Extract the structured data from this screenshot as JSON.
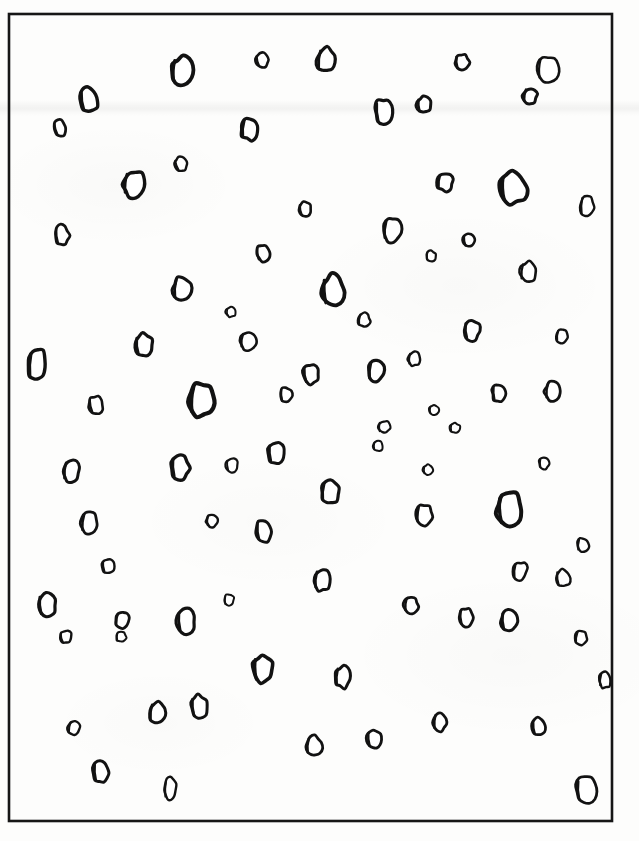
{
  "figure": {
    "title": "",
    "caption": "",
    "medium": "scanned line drawing",
    "background_color": "#fdfdfc",
    "ink_color": "#121212"
  },
  "frame": {
    "x": 9,
    "y": 14,
    "width": 603,
    "height": 807,
    "stroke_color": "#161616",
    "stroke_width": 2.6
  },
  "chart_data": {
    "type": "scatter",
    "title": "",
    "xlabel": "",
    "ylabel": "",
    "xlim": [
      9,
      612
    ],
    "ylim": [
      14,
      821
    ],
    "grid": false,
    "legend": false,
    "marker_style": "hand-drawn irregular oval outline",
    "count": 85,
    "note": "Each point is an irregular closed outline (particle / cell profile) drawn by hand; rx and ry are the semi-axes in pixels, rot is the rotation in degrees, w is the pen stroke width in pixels, and seed drives the outline irregularity.",
    "points": [
      {
        "id": 1,
        "cx": 89,
        "cy": 100,
        "rx": 9,
        "ry": 12,
        "rot": -8,
        "w": 3.4,
        "seed": 11
      },
      {
        "id": 2,
        "cx": 182,
        "cy": 71,
        "rx": 11,
        "ry": 14,
        "rot": 4,
        "w": 3.8,
        "seed": 23
      },
      {
        "id": 3,
        "cx": 262,
        "cy": 60,
        "rx": 6,
        "ry": 7,
        "rot": -14,
        "w": 2.6,
        "seed": 37
      },
      {
        "id": 4,
        "cx": 326,
        "cy": 60,
        "rx": 9,
        "ry": 12,
        "rot": 6,
        "w": 3.2,
        "seed": 41
      },
      {
        "id": 5,
        "cx": 462,
        "cy": 62,
        "rx": 7,
        "ry": 8,
        "rot": -6,
        "w": 2.8,
        "seed": 53
      },
      {
        "id": 6,
        "cx": 548,
        "cy": 69,
        "rx": 11,
        "ry": 13,
        "rot": 3,
        "w": 2.6,
        "seed": 59
      },
      {
        "id": 7,
        "cx": 60,
        "cy": 128,
        "rx": 6,
        "ry": 8,
        "rot": -16,
        "w": 2.8,
        "seed": 67
      },
      {
        "id": 8,
        "cx": 250,
        "cy": 129,
        "rx": 9,
        "ry": 11,
        "rot": 5,
        "w": 3.2,
        "seed": 71
      },
      {
        "id": 9,
        "cx": 384,
        "cy": 112,
        "rx": 9,
        "ry": 13,
        "rot": -5,
        "w": 3.2,
        "seed": 83
      },
      {
        "id": 10,
        "cx": 530,
        "cy": 96,
        "rx": 7,
        "ry": 8,
        "rot": 10,
        "w": 3.0,
        "seed": 89
      },
      {
        "id": 11,
        "cx": 181,
        "cy": 164,
        "rx": 6,
        "ry": 7,
        "rot": -20,
        "w": 2.4,
        "seed": 97
      },
      {
        "id": 12,
        "cx": 134,
        "cy": 184,
        "rx": 11,
        "ry": 13,
        "rot": 6,
        "w": 3.4,
        "seed": 101
      },
      {
        "id": 13,
        "cx": 305,
        "cy": 209,
        "rx": 6,
        "ry": 7,
        "rot": -11,
        "w": 2.6,
        "seed": 103
      },
      {
        "id": 14,
        "cx": 445,
        "cy": 182,
        "rx": 8,
        "ry": 9,
        "rot": 7,
        "w": 3.0,
        "seed": 107
      },
      {
        "id": 15,
        "cx": 513,
        "cy": 188,
        "rx": 13,
        "ry": 16,
        "rot": -3,
        "w": 3.8,
        "seed": 109
      },
      {
        "id": 16,
        "cx": 587,
        "cy": 206,
        "rx": 7,
        "ry": 11,
        "rot": 2,
        "w": 2.4,
        "seed": 113
      },
      {
        "id": 17,
        "cx": 62,
        "cy": 235,
        "rx": 7,
        "ry": 10,
        "rot": -7,
        "w": 2.8,
        "seed": 127
      },
      {
        "id": 18,
        "cx": 392,
        "cy": 230,
        "rx": 9,
        "ry": 12,
        "rot": 5,
        "w": 3.0,
        "seed": 131
      },
      {
        "id": 19,
        "cx": 263,
        "cy": 253,
        "rx": 7,
        "ry": 8,
        "rot": -9,
        "w": 2.8,
        "seed": 137
      },
      {
        "id": 20,
        "cx": 431,
        "cy": 256,
        "rx": 5,
        "ry": 5,
        "rot": 0,
        "w": 2.2,
        "seed": 139
      },
      {
        "id": 21,
        "cx": 182,
        "cy": 289,
        "rx": 9,
        "ry": 12,
        "rot": 4,
        "w": 3.2,
        "seed": 149
      },
      {
        "id": 22,
        "cx": 333,
        "cy": 291,
        "rx": 11,
        "ry": 16,
        "rot": -4,
        "w": 3.8,
        "seed": 151
      },
      {
        "id": 23,
        "cx": 528,
        "cy": 272,
        "rx": 8,
        "ry": 10,
        "rot": 6,
        "w": 2.6,
        "seed": 157
      },
      {
        "id": 24,
        "cx": 144,
        "cy": 345,
        "rx": 9,
        "ry": 11,
        "rot": -6,
        "w": 3.2,
        "seed": 163
      },
      {
        "id": 25,
        "cx": 248,
        "cy": 341,
        "rx": 8,
        "ry": 9,
        "rot": 8,
        "w": 2.6,
        "seed": 167
      },
      {
        "id": 26,
        "cx": 472,
        "cy": 330,
        "rx": 8,
        "ry": 10,
        "rot": -5,
        "w": 3.0,
        "seed": 173
      },
      {
        "id": 27,
        "cx": 37,
        "cy": 365,
        "rx": 9,
        "ry": 16,
        "rot": 3,
        "w": 3.4,
        "seed": 179
      },
      {
        "id": 28,
        "cx": 311,
        "cy": 374,
        "rx": 8,
        "ry": 10,
        "rot": -8,
        "w": 3.0,
        "seed": 181
      },
      {
        "id": 29,
        "cx": 376,
        "cy": 371,
        "rx": 8,
        "ry": 11,
        "rot": 5,
        "w": 3.2,
        "seed": 191
      },
      {
        "id": 30,
        "cx": 499,
        "cy": 393,
        "rx": 7,
        "ry": 9,
        "rot": -4,
        "w": 2.8,
        "seed": 193
      },
      {
        "id": 31,
        "cx": 553,
        "cy": 391,
        "rx": 8,
        "ry": 10,
        "rot": 6,
        "w": 2.8,
        "seed": 197
      },
      {
        "id": 32,
        "cx": 96,
        "cy": 405,
        "rx": 7,
        "ry": 9,
        "rot": -12,
        "w": 2.6,
        "seed": 199
      },
      {
        "id": 33,
        "cx": 202,
        "cy": 400,
        "rx": 13,
        "ry": 17,
        "rot": 4,
        "w": 4.2,
        "seed": 211
      },
      {
        "id": 34,
        "cx": 384,
        "cy": 427,
        "rx": 6,
        "ry": 6,
        "rot": 0,
        "w": 2.2,
        "seed": 223
      },
      {
        "id": 35,
        "cx": 434,
        "cy": 410,
        "rx": 5,
        "ry": 5,
        "rot": 0,
        "w": 2.0,
        "seed": 227
      },
      {
        "id": 36,
        "cx": 276,
        "cy": 453,
        "rx": 8,
        "ry": 11,
        "rot": -5,
        "w": 3.0,
        "seed": 229
      },
      {
        "id": 37,
        "cx": 71,
        "cy": 471,
        "rx": 8,
        "ry": 11,
        "rot": 6,
        "w": 3.0,
        "seed": 233
      },
      {
        "id": 38,
        "cx": 180,
        "cy": 467,
        "rx": 9,
        "ry": 12,
        "rot": -4,
        "w": 3.4,
        "seed": 239
      },
      {
        "id": 39,
        "cx": 544,
        "cy": 463,
        "rx": 5,
        "ry": 6,
        "rot": 0,
        "w": 2.2,
        "seed": 241
      },
      {
        "id": 40,
        "cx": 330,
        "cy": 492,
        "rx": 9,
        "ry": 12,
        "rot": 5,
        "w": 3.2,
        "seed": 251
      },
      {
        "id": 41,
        "cx": 510,
        "cy": 510,
        "rx": 13,
        "ry": 17,
        "rot": -4,
        "w": 4.0,
        "seed": 257
      },
      {
        "id": 42,
        "cx": 89,
        "cy": 523,
        "rx": 8,
        "ry": 11,
        "rot": 7,
        "w": 2.8,
        "seed": 263
      },
      {
        "id": 43,
        "cx": 212,
        "cy": 521,
        "rx": 6,
        "ry": 6,
        "rot": 0,
        "w": 2.4,
        "seed": 269
      },
      {
        "id": 44,
        "cx": 264,
        "cy": 531,
        "rx": 8,
        "ry": 11,
        "rot": -6,
        "w": 3.0,
        "seed": 271
      },
      {
        "id": 45,
        "cx": 424,
        "cy": 515,
        "rx": 8,
        "ry": 10,
        "rot": 4,
        "w": 2.8,
        "seed": 277
      },
      {
        "id": 46,
        "cx": 563,
        "cy": 578,
        "rx": 7,
        "ry": 9,
        "rot": -7,
        "w": 2.4,
        "seed": 281
      },
      {
        "id": 47,
        "cx": 322,
        "cy": 580,
        "rx": 8,
        "ry": 11,
        "rot": 5,
        "w": 3.0,
        "seed": 283
      },
      {
        "id": 48,
        "cx": 47,
        "cy": 605,
        "rx": 9,
        "ry": 12,
        "rot": -5,
        "w": 3.2,
        "seed": 293
      },
      {
        "id": 49,
        "cx": 122,
        "cy": 620,
        "rx": 7,
        "ry": 8,
        "rot": 9,
        "w": 2.8,
        "seed": 307
      },
      {
        "id": 50,
        "cx": 186,
        "cy": 621,
        "rx": 9,
        "ry": 12,
        "rot": -4,
        "w": 3.2,
        "seed": 311
      },
      {
        "id": 51,
        "cx": 411,
        "cy": 605,
        "rx": 7,
        "ry": 8,
        "rot": 6,
        "w": 2.8,
        "seed": 313
      },
      {
        "id": 52,
        "cx": 509,
        "cy": 621,
        "rx": 8,
        "ry": 11,
        "rot": -5,
        "w": 3.0,
        "seed": 317
      },
      {
        "id": 53,
        "cx": 66,
        "cy": 637,
        "rx": 6,
        "ry": 6,
        "rot": -15,
        "w": 2.4,
        "seed": 331
      },
      {
        "id": 54,
        "cx": 581,
        "cy": 638,
        "rx": 6,
        "ry": 7,
        "rot": 8,
        "w": 2.4,
        "seed": 337
      },
      {
        "id": 55,
        "cx": 343,
        "cy": 677,
        "rx": 8,
        "ry": 11,
        "rot": 4,
        "w": 3.0,
        "seed": 347
      },
      {
        "id": 56,
        "cx": 263,
        "cy": 669,
        "rx": 10,
        "ry": 14,
        "rot": -3,
        "w": 3.6,
        "seed": 349
      },
      {
        "id": 57,
        "cx": 157,
        "cy": 713,
        "rx": 8,
        "ry": 11,
        "rot": 6,
        "w": 3.0,
        "seed": 353
      },
      {
        "id": 58,
        "cx": 199,
        "cy": 707,
        "rx": 8,
        "ry": 12,
        "rot": -5,
        "w": 3.0,
        "seed": 359
      },
      {
        "id": 59,
        "cx": 74,
        "cy": 728,
        "rx": 6,
        "ry": 7,
        "rot": 10,
        "w": 2.4,
        "seed": 367
      },
      {
        "id": 60,
        "cx": 374,
        "cy": 739,
        "rx": 7,
        "ry": 9,
        "rot": -6,
        "w": 2.8,
        "seed": 373
      },
      {
        "id": 61,
        "cx": 440,
        "cy": 722,
        "rx": 7,
        "ry": 9,
        "rot": 5,
        "w": 2.8,
        "seed": 379
      },
      {
        "id": 62,
        "cx": 539,
        "cy": 727,
        "rx": 7,
        "ry": 9,
        "rot": -7,
        "w": 2.8,
        "seed": 383
      },
      {
        "id": 63,
        "cx": 314,
        "cy": 746,
        "rx": 8,
        "ry": 10,
        "rot": 4,
        "w": 2.8,
        "seed": 389
      },
      {
        "id": 64,
        "cx": 101,
        "cy": 772,
        "rx": 8,
        "ry": 11,
        "rot": -4,
        "w": 3.0,
        "seed": 397
      },
      {
        "id": 65,
        "cx": 170,
        "cy": 789,
        "rx": 6,
        "ry": 11,
        "rot": 2,
        "w": 2.4,
        "seed": 401
      },
      {
        "id": 66,
        "cx": 586,
        "cy": 790,
        "rx": 10,
        "ry": 13,
        "rot": -3,
        "w": 2.8,
        "seed": 409
      },
      {
        "id": 67,
        "cx": 328,
        "cy": 41,
        "rx": 0,
        "ry": 0,
        "rot": 0,
        "w": 0,
        "seed": 0
      },
      {
        "id": 68,
        "cx": 424,
        "cy": 105,
        "rx": 7,
        "ry": 8,
        "rot": -5,
        "w": 3.0,
        "seed": 419
      },
      {
        "id": 69,
        "cx": 231,
        "cy": 312,
        "rx": 5,
        "ry": 5,
        "rot": 0,
        "w": 2.0,
        "seed": 421
      },
      {
        "id": 70,
        "cx": 428,
        "cy": 470,
        "rx": 5,
        "ry": 5,
        "rot": 0,
        "w": 2.0,
        "seed": 431
      },
      {
        "id": 71,
        "cx": 455,
        "cy": 428,
        "rx": 5,
        "ry": 5,
        "rot": 0,
        "w": 2.0,
        "seed": 433
      },
      {
        "id": 72,
        "cx": 378,
        "cy": 446,
        "rx": 5,
        "ry": 5,
        "rot": 0,
        "w": 2.0,
        "seed": 439
      },
      {
        "id": 73,
        "cx": 520,
        "cy": 571,
        "rx": 7,
        "ry": 9,
        "rot": 5,
        "w": 2.6,
        "seed": 443
      },
      {
        "id": 74,
        "cx": 466,
        "cy": 617,
        "rx": 7,
        "ry": 9,
        "rot": -5,
        "w": 2.8,
        "seed": 449
      },
      {
        "id": 75,
        "cx": 605,
        "cy": 680,
        "rx": 6,
        "ry": 8,
        "rot": 6,
        "w": 2.4,
        "seed": 457
      },
      {
        "id": 76,
        "cx": 229,
        "cy": 600,
        "rx": 5,
        "ry": 6,
        "rot": 0,
        "w": 2.0,
        "seed": 461
      },
      {
        "id": 77,
        "cx": 121,
        "cy": 637,
        "rx": 5,
        "ry": 5,
        "rot": 0,
        "w": 2.0,
        "seed": 463
      },
      {
        "id": 78,
        "cx": 583,
        "cy": 545,
        "rx": 6,
        "ry": 7,
        "rot": 5,
        "w": 2.4,
        "seed": 467
      },
      {
        "id": 79,
        "cx": 232,
        "cy": 465,
        "rx": 6,
        "ry": 7,
        "rot": -6,
        "w": 2.2,
        "seed": 479
      },
      {
        "id": 80,
        "cx": 414,
        "cy": 359,
        "rx": 6,
        "ry": 7,
        "rot": 4,
        "w": 2.4,
        "seed": 487
      },
      {
        "id": 81,
        "cx": 469,
        "cy": 240,
        "rx": 6,
        "ry": 7,
        "rot": -9,
        "w": 2.6,
        "seed": 491
      },
      {
        "id": 82,
        "cx": 364,
        "cy": 320,
        "rx": 6,
        "ry": 7,
        "rot": 7,
        "w": 2.4,
        "seed": 499
      },
      {
        "id": 83,
        "cx": 108,
        "cy": 566,
        "rx": 6,
        "ry": 7,
        "rot": -8,
        "w": 2.4,
        "seed": 503
      },
      {
        "id": 84,
        "cx": 562,
        "cy": 336,
        "rx": 6,
        "ry": 7,
        "rot": 6,
        "w": 2.4,
        "seed": 509
      },
      {
        "id": 85,
        "cx": 286,
        "cy": 395,
        "rx": 6,
        "ry": 8,
        "rot": -5,
        "w": 2.6,
        "seed": 521
      }
    ]
  }
}
